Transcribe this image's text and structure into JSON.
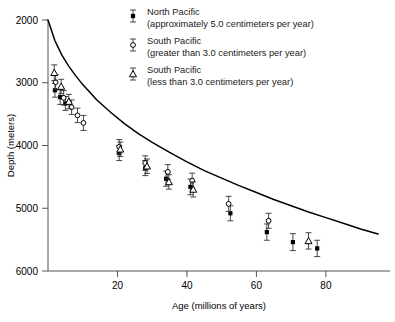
{
  "chart_data": {
    "type": "scatter",
    "title": "",
    "xlabel": "Age (millions of years)",
    "ylabel": "Depth (meters)",
    "xlim": [
      0,
      95
    ],
    "ylim": [
      2000,
      6000
    ],
    "y_inverted": true,
    "grid": false,
    "legend_position": "top-right-inside",
    "xticks": [
      20,
      40,
      60,
      80
    ],
    "yticks": [
      2000,
      3000,
      4000,
      5000,
      6000
    ],
    "xtick_labels": [
      "20",
      "40",
      "60",
      "80"
    ],
    "ytick_labels": [
      "2000",
      "3000",
      "4000",
      "5000",
      "6000"
    ],
    "series": [
      {
        "name": "North Pacific",
        "qualifier": "(approximately 5.0 centimeters per year)",
        "marker": "filled-square",
        "color": "#000000",
        "points": [
          {
            "x": 2.0,
            "y": 3120,
            "yerr": 110
          },
          {
            "x": 3.5,
            "y": 3230,
            "yerr": 115
          },
          {
            "x": 5.0,
            "y": 3330,
            "yerr": 110
          },
          {
            "x": 20.5,
            "y": 4120,
            "yerr": 120
          },
          {
            "x": 28.0,
            "y": 4360,
            "yerr": 120
          },
          {
            "x": 34.0,
            "y": 4530,
            "yerr": 120
          },
          {
            "x": 41.0,
            "y": 4660,
            "yerr": 125
          },
          {
            "x": 52.5,
            "y": 5080,
            "yerr": 120
          },
          {
            "x": 63.0,
            "y": 5380,
            "yerr": 130
          },
          {
            "x": 70.5,
            "y": 5540,
            "yerr": 135
          },
          {
            "x": 77.5,
            "y": 5640,
            "yerr": 130
          }
        ]
      },
      {
        "name": "South Pacific",
        "qualifier": "(greater than 3.0 centimeters per year)",
        "marker": "open-circle",
        "color": "#000000",
        "points": [
          {
            "x": 2.2,
            "y": 2990,
            "yerr": 120
          },
          {
            "x": 4.5,
            "y": 3240,
            "yerr": 115
          },
          {
            "x": 6.8,
            "y": 3390,
            "yerr": 115
          },
          {
            "x": 8.5,
            "y": 3520,
            "yerr": 115
          },
          {
            "x": 10.2,
            "y": 3640,
            "yerr": 120
          },
          {
            "x": 20.5,
            "y": 4020,
            "yerr": 115
          },
          {
            "x": 28.0,
            "y": 4280,
            "yerr": 115
          },
          {
            "x": 34.5,
            "y": 4420,
            "yerr": 115
          },
          {
            "x": 41.5,
            "y": 4560,
            "yerr": 120
          },
          {
            "x": 52.0,
            "y": 4930,
            "yerr": 120
          },
          {
            "x": 63.5,
            "y": 5200,
            "yerr": 120
          }
        ]
      },
      {
        "name": "South Pacific",
        "qualifier": "(less than 3.0 centimeters per year)",
        "marker": "open-triangle",
        "color": "#000000",
        "points": [
          {
            "x": 1.8,
            "y": 2840,
            "yerr": 125
          },
          {
            "x": 3.8,
            "y": 3060,
            "yerr": 115
          },
          {
            "x": 6.0,
            "y": 3300,
            "yerr": 115
          },
          {
            "x": 20.8,
            "y": 4060,
            "yerr": 115
          },
          {
            "x": 28.5,
            "y": 4330,
            "yerr": 115
          },
          {
            "x": 34.8,
            "y": 4580,
            "yerr": 115
          },
          {
            "x": 41.8,
            "y": 4700,
            "yerr": 120
          },
          {
            "x": 75.0,
            "y": 5520,
            "yerr": 130
          }
        ]
      }
    ],
    "curve": {
      "name": "theoretical-subsidence-curve",
      "description": "smooth monotonic depth-age subsidence curve",
      "points": [
        {
          "x": 0,
          "y": 2000
        },
        {
          "x": 2,
          "y": 2330
        },
        {
          "x": 4,
          "y": 2560
        },
        {
          "x": 6,
          "y": 2740
        },
        {
          "x": 8,
          "y": 2890
        },
        {
          "x": 10,
          "y": 3030
        },
        {
          "x": 14,
          "y": 3270
        },
        {
          "x": 18,
          "y": 3470
        },
        {
          "x": 22,
          "y": 3650
        },
        {
          "x": 26,
          "y": 3810
        },
        {
          "x": 30,
          "y": 3950
        },
        {
          "x": 35,
          "y": 4110
        },
        {
          "x": 40,
          "y": 4260
        },
        {
          "x": 45,
          "y": 4400
        },
        {
          "x": 50,
          "y": 4520
        },
        {
          "x": 55,
          "y": 4640
        },
        {
          "x": 60,
          "y": 4750
        },
        {
          "x": 65,
          "y": 4860
        },
        {
          "x": 70,
          "y": 4960
        },
        {
          "x": 75,
          "y": 5060
        },
        {
          "x": 80,
          "y": 5150
        },
        {
          "x": 85,
          "y": 5240
        },
        {
          "x": 90,
          "y": 5330
        },
        {
          "x": 95,
          "y": 5410
        }
      ]
    },
    "legend": [
      {
        "marker": "filled-square",
        "line1": "North Pacific",
        "line2": "(approximately 5.0 centimeters per year)"
      },
      {
        "marker": "open-circle",
        "line1": "South Pacific",
        "line2": "(greater than 3.0 centimeters per year)"
      },
      {
        "marker": "open-triangle",
        "line1": "South Pacific",
        "line2": "(less than 3.0 centimeters per year)"
      }
    ]
  }
}
